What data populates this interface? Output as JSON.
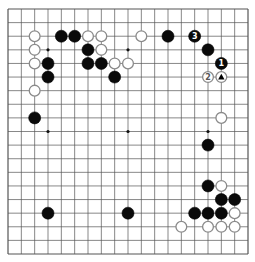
{
  "board": {
    "size": 19,
    "line_color": "#555555",
    "star_points": [
      [
        3,
        3
      ],
      [
        9,
        3
      ],
      [
        15,
        3
      ],
      [
        3,
        9
      ],
      [
        9,
        9
      ],
      [
        15,
        9
      ],
      [
        3,
        15
      ],
      [
        9,
        15
      ],
      [
        15,
        15
      ]
    ],
    "stones": [
      {
        "color": "black",
        "col": 4,
        "row": 2
      },
      {
        "color": "black",
        "col": 5,
        "row": 2
      },
      {
        "color": "black",
        "col": 12,
        "row": 2
      },
      {
        "color": "black",
        "col": 14,
        "row": 2,
        "label": "3"
      },
      {
        "color": "black",
        "col": 6,
        "row": 3
      },
      {
        "color": "black",
        "col": 15,
        "row": 3
      },
      {
        "color": "black",
        "col": 3,
        "row": 4
      },
      {
        "color": "black",
        "col": 6,
        "row": 4
      },
      {
        "color": "black",
        "col": 7,
        "row": 4
      },
      {
        "color": "black",
        "col": 16,
        "row": 4,
        "label": "1"
      },
      {
        "color": "black",
        "col": 3,
        "row": 5
      },
      {
        "color": "black",
        "col": 8,
        "row": 5
      },
      {
        "color": "black",
        "col": 2,
        "row": 8
      },
      {
        "color": "black",
        "col": 15,
        "row": 10
      },
      {
        "color": "black",
        "col": 15,
        "row": 13
      },
      {
        "color": "black",
        "col": 16,
        "row": 14
      },
      {
        "color": "black",
        "col": 17,
        "row": 14
      },
      {
        "color": "black",
        "col": 3,
        "row": 15
      },
      {
        "color": "black",
        "col": 9,
        "row": 15
      },
      {
        "color": "black",
        "col": 14,
        "row": 15
      },
      {
        "color": "black",
        "col": 15,
        "row": 15
      },
      {
        "color": "black",
        "col": 16,
        "row": 15
      },
      {
        "color": "white",
        "col": 2,
        "row": 2
      },
      {
        "color": "white",
        "col": 6,
        "row": 2
      },
      {
        "color": "white",
        "col": 7,
        "row": 2
      },
      {
        "color": "white",
        "col": 10,
        "row": 2
      },
      {
        "color": "white",
        "col": 2,
        "row": 3
      },
      {
        "color": "white",
        "col": 7,
        "row": 3
      },
      {
        "color": "white",
        "col": 2,
        "row": 4
      },
      {
        "color": "white",
        "col": 8,
        "row": 4
      },
      {
        "color": "white",
        "col": 9,
        "row": 4
      },
      {
        "color": "white",
        "col": 15,
        "row": 5,
        "label": "2"
      },
      {
        "color": "white",
        "col": 16,
        "row": 5,
        "marker": "triangle"
      },
      {
        "color": "white",
        "col": 2,
        "row": 6
      },
      {
        "color": "white",
        "col": 16,
        "row": 8
      },
      {
        "color": "white",
        "col": 16,
        "row": 13
      },
      {
        "color": "white",
        "col": 17,
        "row": 15
      },
      {
        "color": "white",
        "col": 13,
        "row": 16
      },
      {
        "color": "white",
        "col": 15,
        "row": 16
      },
      {
        "color": "white",
        "col": 16,
        "row": 16
      },
      {
        "color": "white",
        "col": 17,
        "row": 16
      }
    ]
  }
}
